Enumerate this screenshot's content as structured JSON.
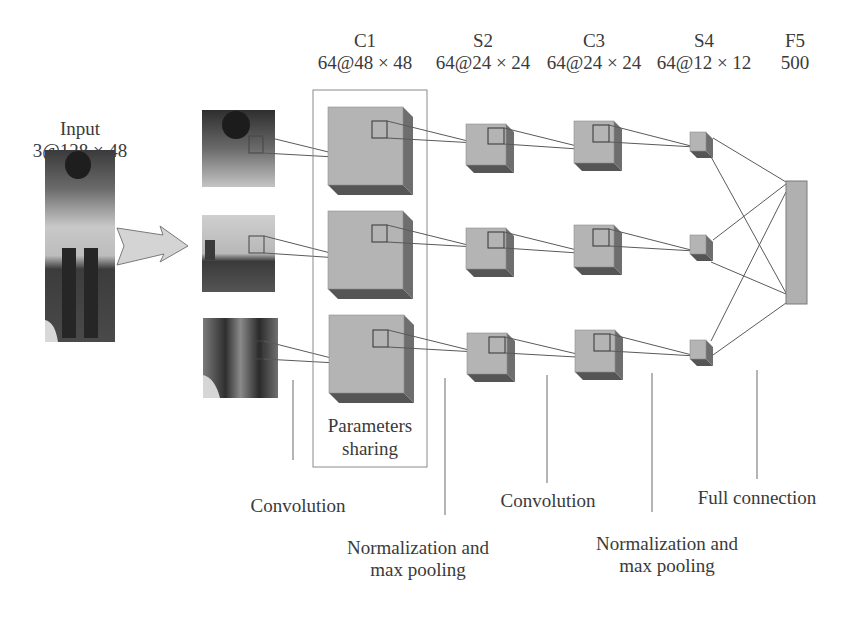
{
  "input": {
    "name": "Input",
    "shape": "3@128 × 48"
  },
  "layers": [
    {
      "id": "C1",
      "name": "C1",
      "shape": "64@48 × 48"
    },
    {
      "id": "S2",
      "name": "S2",
      "shape": "64@24 × 24"
    },
    {
      "id": "C3",
      "name": "C3",
      "shape": "64@24 × 24"
    },
    {
      "id": "S4",
      "name": "S4",
      "shape": "64@12 × 12"
    },
    {
      "id": "F5",
      "name": "F5",
      "shape": "500"
    }
  ],
  "parameter_sharing": {
    "line1": "Parameters",
    "line2": "sharing"
  },
  "operations": {
    "conv1": "Convolution",
    "pool1_line1": "Normalization and",
    "pool1_line2": "max pooling",
    "conv2": "Convolution",
    "pool2_line1": "Normalization and",
    "pool2_line2": "max pooling",
    "fc": "Full connection"
  },
  "parts": [
    "upper-body crop",
    "middle-body crop",
    "lower-body crop"
  ],
  "colors": {
    "cube_front": "#b4b4b4",
    "cube_side": "#6e6e6e",
    "cube_bottom": "#555555",
    "line": "#5a5a5a",
    "arrow_fill": "#d2d2d2",
    "box_border": "#8a8a8a"
  }
}
